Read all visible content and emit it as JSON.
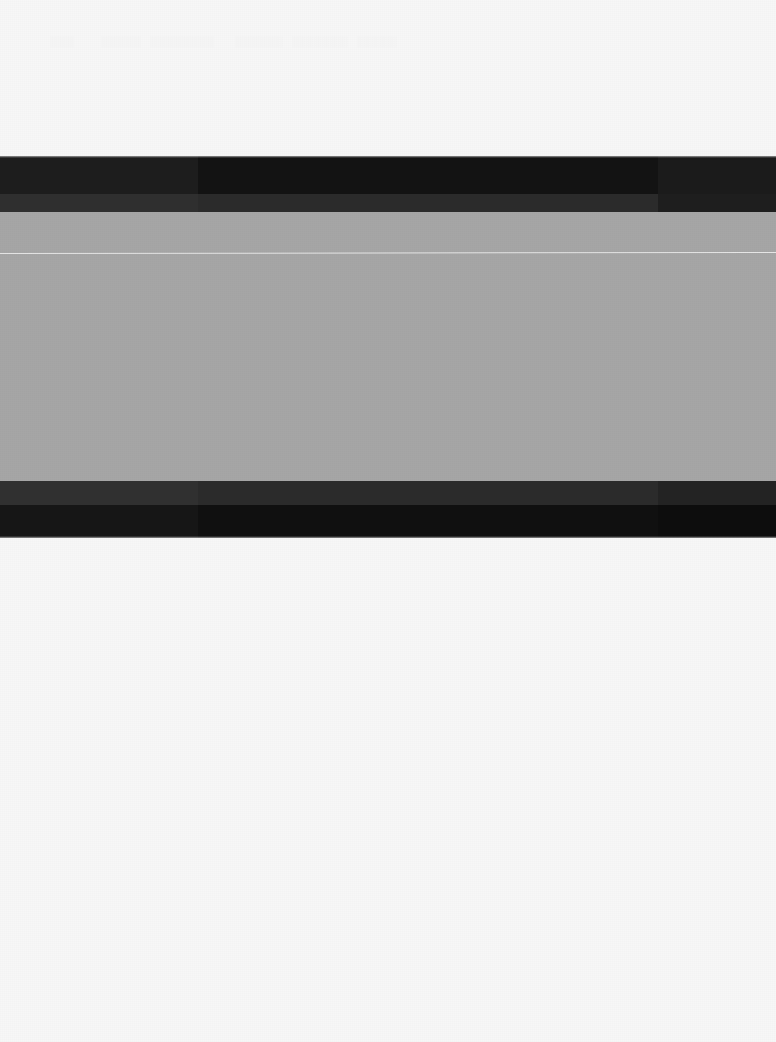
{
  "frame": {
    "width": 776,
    "height": 1042,
    "background_color": "#f7f7f7",
    "page_background_color": "#ffffff",
    "description": "Heavily washed-out / degraded screenshot: an off-white page with a wide horizontal banded block across the upper-middle area and no legible text."
  },
  "ghost_text": {
    "legible": false,
    "note": "Row of extremely low-contrast ghost glyphs near the top edge; contrast is at the noise floor and no characters can be resolved.",
    "fragments": [
      "░░░",
      "░░░░░",
      "░░░░░░░░",
      "░░░░░░",
      "░░░░░░░",
      "░░░░░"
    ]
  },
  "band_block": {
    "top": 156,
    "left": 0,
    "width": 776,
    "height": 382,
    "segments_x": [
      0,
      198,
      658,
      776
    ],
    "bands": [
      {
        "name": "top-dark",
        "top_offset": 0,
        "height": 38,
        "colors": [
          "#1d1d1d",
          "#131313",
          "#1b1b1b"
        ]
      },
      {
        "name": "top-mid",
        "top_offset": 38,
        "height": 18,
        "colors": [
          "#2f2f2f",
          "#2b2b2b",
          "#1e1e1e"
        ]
      },
      {
        "name": "gray-field",
        "top_offset": 56,
        "height": 269,
        "colors": [
          "#a6a6a6",
          "#a6a6a6",
          "#a6a6a6"
        ]
      },
      {
        "name": "bottom-mid",
        "top_offset": 325,
        "height": 24,
        "colors": [
          "#303030",
          "#2b2b2b",
          "#232323"
        ]
      },
      {
        "name": "bottom-dark",
        "top_offset": 349,
        "height": 33,
        "colors": [
          "#161616",
          "#101010",
          "#0d0d0d"
        ]
      }
    ]
  },
  "scanline": {
    "name": "thin-light-rule",
    "top_offset_in_block": 97,
    "absolute_y": 253,
    "color": "rgba(255,255,255,0.72)",
    "thickness_px": 1,
    "spans_full_width": true
  },
  "lower_region": {
    "top": 538,
    "height": 504,
    "background_color": "#f7f7f7",
    "content": "empty"
  }
}
